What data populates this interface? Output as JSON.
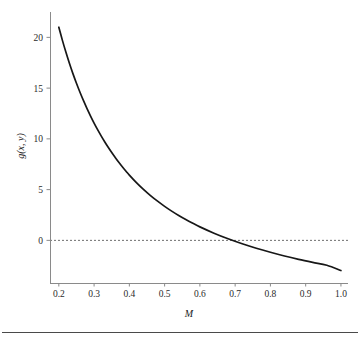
{
  "figure": {
    "background_color": "#ffffff",
    "curve_color": "#171717",
    "axis_color": "#8a8a8a",
    "zero_line_color": "#6e6e6e",
    "footer_rule_color": "#4a4a4a"
  },
  "chart_data": {
    "type": "line",
    "title": "",
    "subtitle": "",
    "xlabel": "M",
    "ylabel": "g(x, y)",
    "xlim": [
      0.175,
      1.02
    ],
    "ylim": [
      -4.2,
      22.5
    ],
    "grid": false,
    "legend": null,
    "xticks": [
      "0.2",
      "0.3",
      "0.4",
      "0.5",
      "0.6",
      "0.7",
      "0.8",
      "0.9",
      "1.0"
    ],
    "xtick_values": [
      0.2,
      0.3,
      0.4,
      0.5,
      0.6,
      0.7,
      0.8,
      0.9,
      1.0
    ],
    "yticks": [
      "0",
      "5",
      "10",
      "15",
      "20"
    ],
    "ytick_values": [
      0,
      5,
      10,
      15,
      20
    ],
    "annotations": [
      {
        "name": "zero-reference-line",
        "kind": "hline",
        "y": 0,
        "style": "dashed"
      }
    ],
    "series": [
      {
        "name": "g(x, y)",
        "style": "solid",
        "x": [
          0.2,
          0.21,
          0.22,
          0.23,
          0.24,
          0.25,
          0.26,
          0.27,
          0.28,
          0.29,
          0.3,
          0.31,
          0.32,
          0.33,
          0.34,
          0.35,
          0.36,
          0.37,
          0.38,
          0.39,
          0.4,
          0.42,
          0.44,
          0.46,
          0.48,
          0.5,
          0.52,
          0.54,
          0.56,
          0.58,
          0.6,
          0.64,
          0.68,
          0.72,
          0.76,
          0.8,
          0.84,
          0.88,
          0.92,
          0.96,
          1.0
        ],
        "y": [
          21.0,
          19.73,
          18.55,
          17.45,
          16.43,
          15.48,
          14.59,
          13.76,
          12.98,
          12.25,
          11.56,
          10.91,
          10.3,
          9.72,
          9.17,
          8.65,
          8.16,
          7.69,
          7.25,
          6.83,
          6.43,
          5.69,
          5.02,
          4.41,
          3.86,
          3.35,
          2.88,
          2.45,
          2.05,
          1.68,
          1.33,
          0.71,
          0.16,
          -0.33,
          -0.77,
          -1.17,
          -1.54,
          -1.87,
          -2.17,
          -2.45,
          -2.97
        ]
      }
    ]
  }
}
